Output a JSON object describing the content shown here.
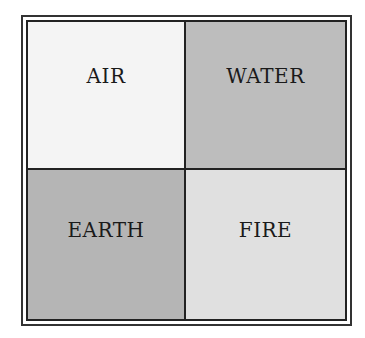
{
  "diagram": {
    "cells": [
      {
        "label": "AIR",
        "fill": "#f4f4f4"
      },
      {
        "label": "WATER",
        "fill": "#bdbdbd"
      },
      {
        "label": "EARTH",
        "fill": "#b5b5b5"
      },
      {
        "label": "FIRE",
        "fill": "#e0e0e0"
      }
    ]
  }
}
